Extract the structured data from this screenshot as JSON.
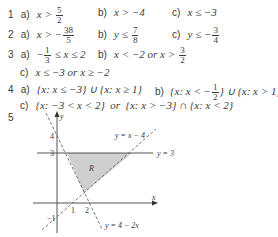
{
  "answers": [
    {
      "number": "1",
      "parts": [
        {
          "label": "a)",
          "lhs": "x >",
          "frac": {
            "num": "5",
            "den": "2"
          },
          "rhs": ""
        },
        {
          "label": "b)",
          "lhs": "x > −4"
        },
        {
          "label": "c)",
          "lhs": "x ≤ −3"
        }
      ]
    },
    {
      "number": "2",
      "parts": [
        {
          "label": "a)",
          "lhs": "x > −",
          "frac": {
            "num": "38",
            "den": "5"
          }
        },
        {
          "label": "b)",
          "lhs": "y ≤",
          "frac": {
            "num": "7",
            "den": "8"
          }
        },
        {
          "label": "c)",
          "lhs": "y ≤ −",
          "frac": {
            "num": "3",
            "den": "4"
          }
        }
      ]
    },
    {
      "number": "3",
      "parts": [
        {
          "label": "a)",
          "pre": "−",
          "frac": {
            "num": "1",
            "den": "3"
          },
          "rhs": "≤ x ≤ 2"
        },
        {
          "label": "b)",
          "lhs": "x < −2 or x >",
          "frac": {
            "num": "3",
            "den": "2"
          }
        },
        {
          "label": "c)",
          "lhs": "x ≤ −3 or x ≥ −2"
        }
      ]
    },
    {
      "number": "4",
      "parts": [
        {
          "label": "a)",
          "lhs": "{x: x ≤ −3} ∪ {x: x ≥ 1}"
        },
        {
          "label": "b)",
          "lhs": "{x: x < −",
          "frac": {
            "num": "1",
            "den": "2"
          },
          "rhs": "} ∪ {x: x > 1}"
        },
        {
          "label": "c)",
          "lhs": "{x: −3 < x < 2}  or  {x: x > −3} ∩ {x: x < 2}"
        }
      ]
    },
    {
      "number": "5",
      "parts": []
    }
  ],
  "graph": {
    "axis_x_label": "x",
    "axis_y_label": "y",
    "tick_labels": {
      "y4": "4",
      "y3": "3",
      "x1": "1",
      "x2": "2",
      "ym1": "−1"
    },
    "lines": {
      "y3": "y = 3",
      "yx4": "y = x − 4",
      "y42x": "y = 4 − 2x"
    },
    "region_label": "R",
    "region_fill": "#cfcfcf",
    "line_color": "#555555"
  }
}
